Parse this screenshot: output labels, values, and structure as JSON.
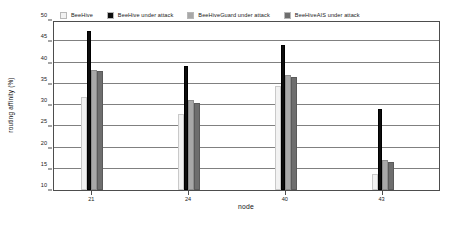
{
  "chart_data": {
    "type": "bar",
    "title": "",
    "xlabel": "node",
    "ylabel": "routing affinity (%)",
    "categories": [
      "21",
      "24",
      "40",
      "43"
    ],
    "ylim": [
      10,
      50
    ],
    "yticks": [
      10,
      15,
      20,
      25,
      30,
      35,
      40,
      45,
      50
    ],
    "grid": true,
    "legend_position": "top",
    "series": [
      {
        "name": "BeeHive",
        "color": "#f2f2f2",
        "values": [
          31.8,
          28.0,
          34.4,
          13.8
        ]
      },
      {
        "name": "BeeHive under attack",
        "color": "#0d0d0d",
        "values": [
          47.3,
          39.2,
          44.2,
          29.0
        ]
      },
      {
        "name": "BeeHiveGuard under attack",
        "color": "#a8a8a8",
        "values": [
          38.2,
          31.2,
          37.0,
          17.0
        ]
      },
      {
        "name": "BeeHiveAIS under attack",
        "color": "#6e6e6e",
        "values": [
          38.0,
          30.5,
          36.6,
          16.7
        ]
      }
    ]
  }
}
